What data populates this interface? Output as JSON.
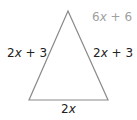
{
  "figure": {
    "shape": "isosceles-triangle",
    "stroke_color": "#8a8a8a",
    "vertices": {
      "apex": [
        68,
        11
      ],
      "base_left": [
        29,
        100
      ],
      "base_right": [
        108,
        100
      ]
    },
    "labels": {
      "perimeter": {
        "coef": "6",
        "var": "x",
        "rest": " + 6"
      },
      "left_side": {
        "coef": "2",
        "var": "x",
        "rest": " + 3"
      },
      "right_side": {
        "coef": "2",
        "var": "x",
        "rest": " + 3"
      },
      "base": {
        "coef": "2",
        "var": "x",
        "rest": ""
      }
    }
  }
}
